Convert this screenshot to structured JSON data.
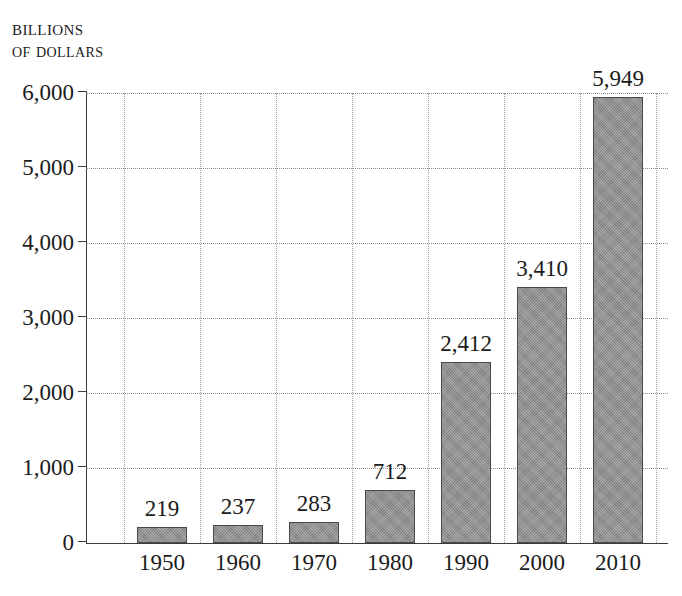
{
  "chart_data": {
    "type": "bar",
    "title": "BILLIONS OF DOLLARS",
    "title_lines": [
      "Billions",
      "of dollars"
    ],
    "xlabel": "",
    "ylabel": "Billions of dollars",
    "categories": [
      "1950",
      "1960",
      "1970",
      "1980",
      "1990",
      "2000",
      "2010"
    ],
    "values": [
      219,
      237,
      283,
      712,
      2412,
      3410,
      5949
    ],
    "value_labels": [
      "219",
      "237",
      "283",
      "712",
      "2,412",
      "3,410",
      "5,949"
    ],
    "ylim": [
      0,
      6000
    ],
    "yticks": [
      0,
      1000,
      2000,
      3000,
      4000,
      5000,
      6000
    ],
    "ytick_labels": [
      "0",
      "1,000",
      "2,000",
      "3,000",
      "4,000",
      "5,000",
      "6,000"
    ],
    "grid": true,
    "grid_style": "dotted",
    "legend": null,
    "bar_color": "#8d8d8d",
    "bar_border_color": "#4a4a4a",
    "axis_color": "#3d3d3d",
    "grid_color": "#8e8e8e",
    "background_color": "#ffffff",
    "text_color": "#1b1b1b"
  }
}
